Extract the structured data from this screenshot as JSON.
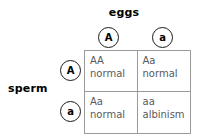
{
  "diagram": {
    "type": "punnett-square",
    "columns_axis_label": "eggs",
    "rows_axis_label": "sperm",
    "column_gametes": [
      "A",
      "a"
    ],
    "row_gametes": [
      "A",
      "a"
    ],
    "colors": {
      "grid_line": "#9a9a9a",
      "cell_text": "#5a5a5a",
      "label_text": "#000000",
      "circle_stroke": "#1a1a1a",
      "background": "#ffffff"
    },
    "cells": [
      {
        "genotype": "AA",
        "phenotype": "normal"
      },
      {
        "genotype": "Aa",
        "phenotype": "normal"
      },
      {
        "genotype": "Aa",
        "phenotype": "normal"
      },
      {
        "genotype": "aa",
        "phenotype": "albinism"
      }
    ]
  }
}
